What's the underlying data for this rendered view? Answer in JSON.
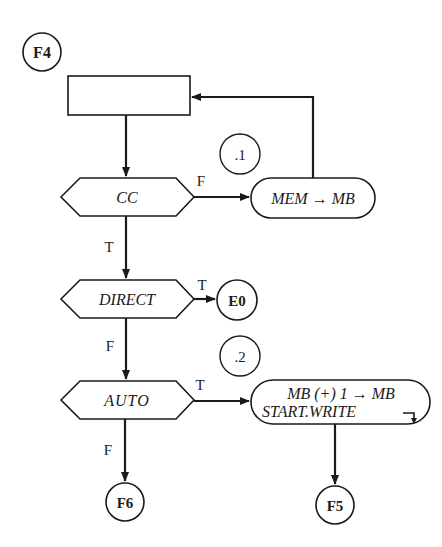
{
  "diagram": {
    "type": "flowchart",
    "colors": {
      "stroke": "#1a1a1a",
      "background": "#ffffff"
    },
    "connectors": {
      "entry": "F4",
      "e0": "E0",
      "f6": "F6",
      "f5": "F5"
    },
    "step_markers": {
      "step1": ".1",
      "step2": ".2"
    },
    "process_box": {
      "label": ""
    },
    "decisions": {
      "cc": "CC",
      "direct": "DIRECT",
      "auto": "AUTO"
    },
    "actions": {
      "mem_to_mb": "MEM → MB",
      "increment_line1": "MB (+) 1 → MB",
      "increment_line2": "START.WRITE"
    },
    "branch_labels": {
      "cc_false": "F",
      "cc_true": "T",
      "direct_true": "T",
      "direct_false": "F",
      "auto_true": "T",
      "auto_false": "F"
    }
  }
}
